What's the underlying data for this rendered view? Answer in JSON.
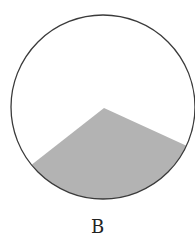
{
  "figure": {
    "label": "B",
    "circle": {
      "cx": 103,
      "cy": 107,
      "r": 92,
      "stroke": "#3a3a3a",
      "fill": "#ffffff"
    },
    "shaded_region": {
      "description": "wedge from circle center to lower-left and right arc",
      "apex": [
        104,
        108
      ],
      "left_point": [
        32,
        164
      ],
      "right_point": [
        186,
        148
      ],
      "fill": "#b3b3b3"
    }
  }
}
